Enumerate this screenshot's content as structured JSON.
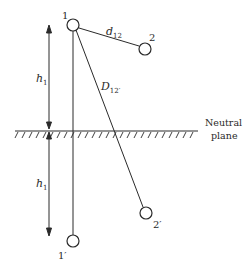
{
  "diagram": {
    "conductors": [
      {
        "id": "1",
        "label": "1",
        "x": 73,
        "y": 25
      },
      {
        "id": "2",
        "label": "2",
        "x": 145,
        "y": 49
      },
      {
        "id": "1prime",
        "label": "1′",
        "x": 73,
        "y": 241
      },
      {
        "id": "2prime",
        "label": "2′",
        "x": 146,
        "y": 213
      }
    ],
    "distances": {
      "d12": {
        "symbol": "d",
        "subscript": "12"
      },
      "D12prime": {
        "symbol": "D",
        "subscript": "12′"
      }
    },
    "heights": {
      "upper": {
        "symbol": "h",
        "subscript": "1"
      },
      "lower": {
        "symbol": "h",
        "subscript": "1"
      }
    },
    "plane": {
      "line1": "Neutral",
      "line2": "plane"
    }
  }
}
